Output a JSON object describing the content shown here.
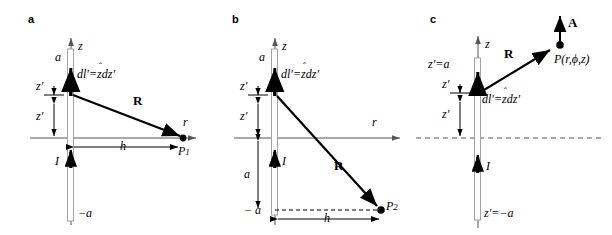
{
  "figure": {
    "type": "physics-diagram",
    "panels": [
      {
        "id": "a",
        "label": "a",
        "axes": {
          "vertical": "z",
          "horizontal": "r"
        },
        "wire": {
          "top_label": "a",
          "bottom_label": "−a",
          "current_label": "I"
        },
        "source_label": "dl′=",
        "source_unit": "z",
        "source_diff": "dz′",
        "distance_vector": "R",
        "field_point": "P",
        "field_point_sub": "1",
        "dimension_h": "h",
        "offset_upper": "z′",
        "offset_lower": "z′"
      },
      {
        "id": "b",
        "label": "b",
        "axes": {
          "vertical": "z",
          "horizontal": "r"
        },
        "wire": {
          "top_label": "a",
          "bottom_label": "− a",
          "current_label": "I"
        },
        "source_label": "dl′=",
        "source_unit": "z",
        "source_diff": "dz′",
        "distance_vector": "R",
        "field_point": "P",
        "field_point_sub": "2",
        "dimension_h": "h",
        "dimension_a": "a",
        "offset_upper": "z′",
        "offset_lower": "z′"
      },
      {
        "id": "c",
        "label": "c",
        "axes": {
          "vertical": "z",
          "horizontal": ""
        },
        "wire": {
          "top_label": "z′=a",
          "bottom_label": "z′=−a",
          "current_label": "I"
        },
        "source_label": "dl′=",
        "source_unit": "z",
        "source_diff": "dz′",
        "distance_vector": "R",
        "field_point": "P(r,ϕ,z)",
        "vector_potential": "A",
        "offset_upper": "z′",
        "offset_lower": "z′"
      }
    ],
    "colors": {
      "ink": "#000000",
      "axis": "#555555",
      "wire_outline": "#9a9a9a"
    }
  }
}
